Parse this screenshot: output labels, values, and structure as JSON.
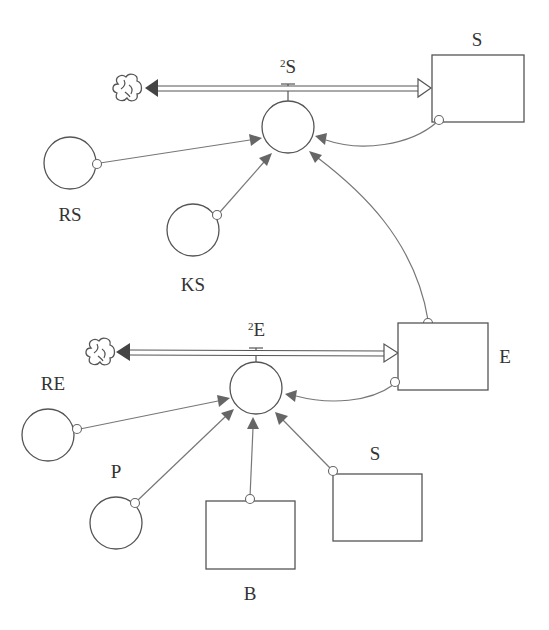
{
  "diagram": {
    "type": "stock-and-flow",
    "colors": {
      "stroke": "#555555",
      "link": "#777777",
      "arrowhead": "#666666",
      "background": "#ffffff"
    },
    "top_sector": {
      "stock_label": "S",
      "flow_label_sup": "2",
      "flow_label": "S",
      "source_icon": "cloud-icon",
      "converters": [
        {
          "id": "RS",
          "label": "RS"
        },
        {
          "id": "KS",
          "label": "KS"
        }
      ]
    },
    "bottom_sector": {
      "stock_label": "E",
      "flow_label_sup": "2",
      "flow_label": "E",
      "source_icon": "cloud-icon",
      "converters": [
        {
          "id": "RE",
          "label": "RE"
        },
        {
          "id": "P",
          "label": "P"
        }
      ],
      "auxiliary_stocks": [
        {
          "id": "B",
          "label": "B"
        },
        {
          "id": "S2",
          "label": "S"
        }
      ]
    },
    "links": [
      {
        "from": "RS",
        "to": "flow_S"
      },
      {
        "from": "KS",
        "to": "flow_S"
      },
      {
        "from": "stock_S",
        "to": "flow_S"
      },
      {
        "from": "stock_E",
        "to": "flow_S"
      },
      {
        "from": "RE",
        "to": "flow_E"
      },
      {
        "from": "P",
        "to": "flow_E"
      },
      {
        "from": "B",
        "to": "flow_E"
      },
      {
        "from": "S2",
        "to": "flow_E"
      },
      {
        "from": "stock_E",
        "to": "flow_E"
      }
    ]
  }
}
